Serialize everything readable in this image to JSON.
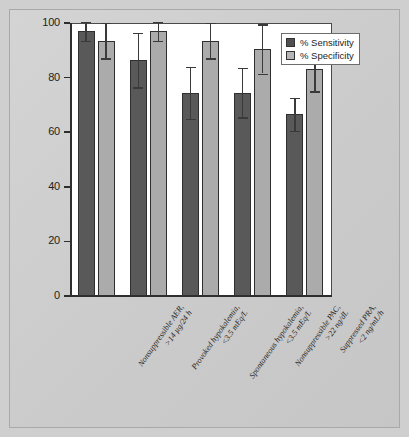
{
  "chart_data": {
    "type": "bar",
    "title": "",
    "subtitle": "",
    "xlabel": "",
    "ylabel": "",
    "ylim": [
      0,
      100
    ],
    "yticks": [
      0,
      20,
      40,
      60,
      80,
      100
    ],
    "grid": false,
    "legend_position": "top-right",
    "categories": [
      "Nonsuppressible AER, >14 µg/24 h",
      "Provoked hypokalemia, <3.5 mEq/L",
      "Spontaneous hypokalemia, <3.5 mEq/L",
      "Nonsuppressible PAC, >22 ng/dL",
      "Suppressed PRA, <2 ng/mL/h"
    ],
    "category_lines": [
      [
        "Nonsuppressible AER,",
        ">14 µg/24 h"
      ],
      [
        "Provoked hypokalemia,",
        "<3.5 mEq/L"
      ],
      [
        "Spontaneous hypokalemia,",
        "<3.5 mEq/L"
      ],
      [
        "Nonsuppressible PAC,",
        ">22 ng/dL"
      ],
      [
        "Suppressed PRA,",
        "<2 ng/mL/h"
      ]
    ],
    "series": [
      {
        "name": "% Sensitivity",
        "color": "#595959",
        "values": [
          97,
          86.5,
          74.5,
          74.5,
          66.5
        ],
        "errors": [
          3.5,
          10,
          9.5,
          9,
          6
        ]
      },
      {
        "name": "% Specificity",
        "color": "#ababab",
        "values": [
          93.5,
          97,
          93.5,
          90.5,
          83
        ],
        "errors": [
          6.5,
          3.5,
          6.5,
          9,
          8
        ]
      }
    ]
  },
  "axis": {
    "tick_labels": [
      "100",
      "80",
      "60",
      "40",
      "20",
      "0"
    ]
  },
  "legend": {
    "items": [
      {
        "label": "% Sensitivity",
        "swatch": "sens"
      },
      {
        "label": "% Specificity",
        "swatch": "spec"
      }
    ]
  }
}
